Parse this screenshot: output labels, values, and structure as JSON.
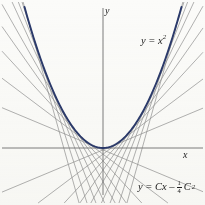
{
  "figure": {
    "title_alt": "Parabola y = x squared with its family of tangent lines",
    "background_color": "#fbfbf9",
    "axis_color": "#7c7c7c",
    "curve_color": "#2b3a6b",
    "tangent_color": "#909090",
    "text_color": "#1c1c1c",
    "origin": {
      "x": 103,
      "y": 148
    },
    "x_axis": {
      "x1": 2,
      "x2": 203,
      "y": 148
    },
    "y_axis": {
      "x": 103,
      "y1": 8,
      "y2": 195
    }
  },
  "labels": {
    "y_axis": "y",
    "x_axis": "x",
    "parabola_prefix": "y = x",
    "parabola_exponent": "2",
    "family_prefix": "y = Cx –",
    "family_fraction_numerator": "1",
    "family_fraction_denominator": "4",
    "family_suffix": "C",
    "family_suffix_exponent": "2"
  },
  "chart_data": {
    "type": "line",
    "title": "",
    "xlabel": "x",
    "ylabel": "y",
    "grid": false,
    "legend": "none",
    "xlim": [
      -2.6,
      2.6
    ],
    "ylim": [
      -2.0,
      4.6
    ],
    "series": [
      {
        "name": "y = x^2",
        "kind": "parabola",
        "equation": "y = x^2",
        "color": "#2b3a6b",
        "width": 1.9,
        "x": [
          -2.15,
          -1.8,
          -1.5,
          -1.2,
          -0.9,
          -0.6,
          -0.3,
          0,
          0.3,
          0.6,
          0.9,
          1.2,
          1.5,
          1.8,
          2.15
        ],
        "y": [
          4.62,
          3.24,
          2.25,
          1.44,
          0.81,
          0.36,
          0.09,
          0,
          0.09,
          0.36,
          0.81,
          1.44,
          2.25,
          3.24,
          4.62
        ]
      },
      {
        "name": "y = Cx - (1/4)C^2 family",
        "kind": "tangent-family",
        "equation": "y = Cx - C^2/4",
        "color": "#909090",
        "width": 0.7,
        "C_values": [
          -4.3,
          -3.7,
          -3.1,
          -2.6,
          -2.1,
          -1.7,
          -1.3,
          -0.9,
          -0.5,
          0.5,
          0.9,
          1.3,
          1.7,
          2.1,
          2.6,
          3.1,
          3.7,
          4.3
        ],
        "note": "each line is tangent to y = x^2 at x = C/2; envelope of the family is the parabola"
      }
    ]
  }
}
